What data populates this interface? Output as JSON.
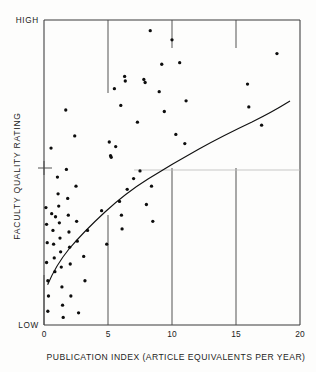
{
  "figure": {
    "name": "faculty-quality-vs-publication-index-scatter",
    "background_color": "#fdfdfc",
    "ink_color": "#111111"
  },
  "chart_data": {
    "type": "scatter",
    "title": "",
    "subtitle": "",
    "xlabel": "PUBLICATION INDEX (ARTICLE EQUIVALENTS PER YEAR)",
    "ylabel": "FACULTY QUALITY RATING",
    "xlim": [
      0,
      20
    ],
    "ylim": [
      0,
      100
    ],
    "xticks": [
      0,
      5,
      10,
      15,
      20
    ],
    "xticklabels": [
      "0",
      "5",
      "10",
      "15",
      "20"
    ],
    "yticklabels": [
      "HIGH",
      "LOW"
    ],
    "y_high_label": "HIGH",
    "y_low_label": "LOW",
    "grid": false,
    "legend": "none",
    "marker": "filled-circle",
    "marker_color": "#0d0d0d",
    "series": [
      {
        "name": "departments",
        "points": [
          [
            0.15,
            38.5
          ],
          [
            0.2,
            33.0
          ],
          [
            0.25,
            27.0
          ],
          [
            0.2,
            20.5
          ],
          [
            0.3,
            14.5
          ],
          [
            0.35,
            9.5
          ],
          [
            0.3,
            4.5
          ],
          [
            0.55,
            58.0
          ],
          [
            0.6,
            36.5
          ],
          [
            0.7,
            31.0
          ],
          [
            0.75,
            26.5
          ],
          [
            0.8,
            22.0
          ],
          [
            0.85,
            17.5
          ],
          [
            0.9,
            35.5
          ],
          [
            1.05,
            48.5
          ],
          [
            1.1,
            43.0
          ],
          [
            1.15,
            39.0
          ],
          [
            1.2,
            33.5
          ],
          [
            1.25,
            28.5
          ],
          [
            1.3,
            24.0
          ],
          [
            1.35,
            19.0
          ],
          [
            1.4,
            12.5
          ],
          [
            1.45,
            6.5
          ],
          [
            1.5,
            2.5
          ],
          [
            1.7,
            70.5
          ],
          [
            1.75,
            51.0
          ],
          [
            1.85,
            41.5
          ],
          [
            1.9,
            36.0
          ],
          [
            1.95,
            30.5
          ],
          [
            2.0,
            25.5
          ],
          [
            2.05,
            20.0
          ],
          [
            2.1,
            9.5
          ],
          [
            2.4,
            62.0
          ],
          [
            2.5,
            45.5
          ],
          [
            2.55,
            34.0
          ],
          [
            2.6,
            27.5
          ],
          [
            2.7,
            4.0
          ],
          [
            3.1,
            22.5
          ],
          [
            3.2,
            14.5
          ],
          [
            3.4,
            31.0
          ],
          [
            4.5,
            37.5
          ],
          [
            4.9,
            26.5
          ],
          [
            5.1,
            60.0
          ],
          [
            5.2,
            55.5
          ],
          [
            5.25,
            55.0
          ],
          [
            5.5,
            77.5
          ],
          [
            5.6,
            58.5
          ],
          [
            5.9,
            40.5
          ],
          [
            6.0,
            72.0
          ],
          [
            6.05,
            36.0
          ],
          [
            6.1,
            31.5
          ],
          [
            6.3,
            81.5
          ],
          [
            6.35,
            80.0
          ],
          [
            6.5,
            44.5
          ],
          [
            7.0,
            48.0
          ],
          [
            7.3,
            66.5
          ],
          [
            7.5,
            50.5
          ],
          [
            7.8,
            80.5
          ],
          [
            7.9,
            79.5
          ],
          [
            8.0,
            39.5
          ],
          [
            8.3,
            96.5
          ],
          [
            8.4,
            45.5
          ],
          [
            8.5,
            34.0
          ],
          [
            9.0,
            76.5
          ],
          [
            9.2,
            85.5
          ],
          [
            9.4,
            70.0
          ],
          [
            10.0,
            93.5
          ],
          [
            10.3,
            62.5
          ],
          [
            10.6,
            86.0
          ],
          [
            11.0,
            59.5
          ],
          [
            11.1,
            73.5
          ],
          [
            15.9,
            79.0
          ],
          [
            16.0,
            71.5
          ],
          [
            17.0,
            65.5
          ],
          [
            18.2,
            89.0
          ]
        ]
      }
    ],
    "fit_curve": {
      "name": "logarithmic-trend-line",
      "description": "smooth concave increasing trend line",
      "points": [
        [
          0.28,
          14.0
        ],
        [
          0.5,
          20.5
        ],
        [
          0.8,
          26.5
        ],
        [
          1.2,
          32.5
        ],
        [
          1.7,
          38.5
        ],
        [
          2.3,
          44.5
        ],
        [
          3.0,
          50.0
        ],
        [
          3.8,
          55.0
        ],
        [
          4.7,
          59.5
        ],
        [
          5.7,
          64.0
        ],
        [
          6.8,
          68.5
        ],
        [
          8.0,
          73.0
        ],
        [
          9.3,
          77.5
        ],
        [
          10.7,
          81.5
        ],
        [
          12.2,
          85.0
        ],
        [
          13.8,
          88.5
        ],
        [
          15.5,
          91.5
        ],
        [
          17.3,
          94.0
        ],
        [
          18.6,
          95.5
        ]
      ]
    },
    "annotations": [
      {
        "name": "scan-fold-line",
        "type": "horizontal-artifact",
        "y": 48.0,
        "x_start": 7.0,
        "x_end": 20.0
      },
      {
        "name": "y-axis-mid-tick",
        "type": "tick",
        "y": 48.0
      }
    ]
  }
}
